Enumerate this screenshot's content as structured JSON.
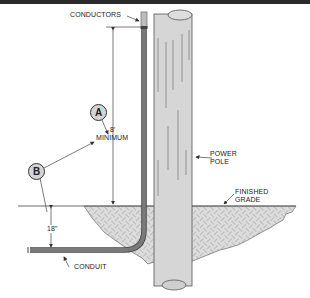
{
  "diagram": {
    "labels": {
      "conductors": "CONDUCTORS",
      "dimension_top_value": "8'",
      "dimension_top_note": "MINIMUM",
      "power_pole_line1": "POWER",
      "power_pole_line2": "POLE",
      "finished_grade_line1": "FINISHED",
      "finished_grade_line2": "GRADE",
      "dimension_depth_value": "18\"",
      "conduit": "CONDUIT"
    },
    "callouts": {
      "a": "A",
      "b": "B"
    },
    "colors": {
      "pole_fill": "#d6d6d6",
      "conduit_fill": "#6e6e6e",
      "callout_fill": "#d4d4d4",
      "line": "#333333",
      "frame_top": "#2a2a2a"
    }
  }
}
